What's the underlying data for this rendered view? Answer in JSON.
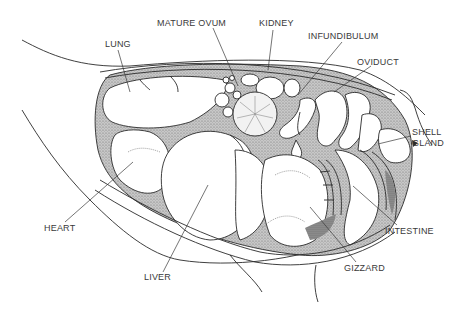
{
  "figure": {
    "type": "anatomical illustration",
    "labels": {
      "mature_ovum": "MATURE OVUM",
      "kidney": "KIDNEY",
      "lung": "LUNG",
      "infundibulum": "INFUNDIBULUM",
      "oviduct": "OVIDUCT",
      "shell_gland_line1": "SHELL",
      "shell_gland_line2": "GLAND",
      "heart": "HEART",
      "intestine": "INTESTINE",
      "liver": "LIVER",
      "gizzard": "GIZZARD"
    },
    "colors": {
      "line": "#2a2a2a",
      "stipple": "#9a9a9a",
      "label_text": "#3a3a3a",
      "background": "#ffffff"
    }
  }
}
